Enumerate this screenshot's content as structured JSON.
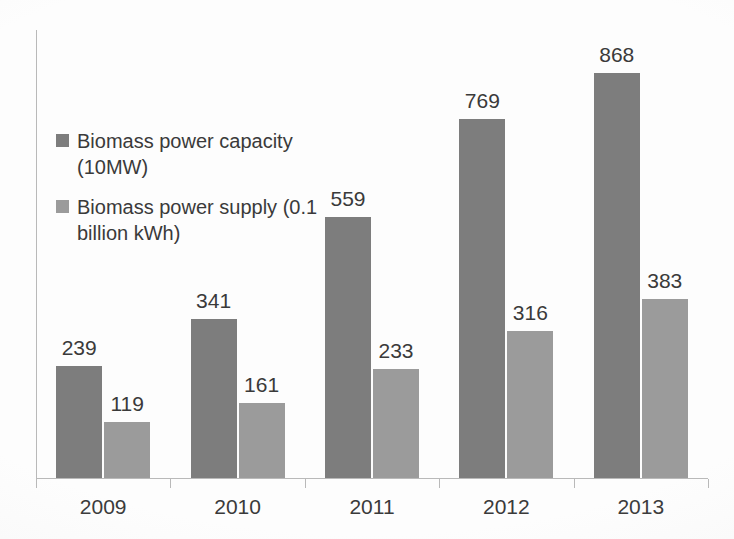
{
  "chart_data": {
    "type": "bar",
    "title": "",
    "subtitle": "",
    "xlabel": "",
    "ylabel": "",
    "grid": false,
    "legend_position": "inside-top-left",
    "y_axis_tick_labels": false,
    "ylim": [
      0,
      960
    ],
    "categories": [
      "2009",
      "2010",
      "2011",
      "2012",
      "2013"
    ],
    "series": [
      {
        "name": "Biomass power capacity (10MW)",
        "color": "#7d7d7d",
        "values": [
          239,
          341,
          559,
          769,
          868
        ],
        "labels": [
          "239",
          "341",
          "559",
          "769",
          "868"
        ]
      },
      {
        "name": "Biomass power supply (0.1 billion kWh)",
        "color": "#9b9b9b",
        "values": [
          119,
          161,
          233,
          316,
          383
        ],
        "labels": [
          "119",
          "161",
          "233",
          "316",
          "383"
        ]
      }
    ]
  },
  "legend": {
    "items": [
      {
        "label": "Biomass power capacity (10MW)",
        "swatch": "legend-swatch-capacity"
      },
      {
        "label": "Biomass power supply (0.1 billion kWh)",
        "swatch": "legend-swatch-supply"
      }
    ]
  },
  "axes": {
    "category_labels": [
      "2009",
      "2010",
      "2011",
      "2012",
      "2013"
    ]
  }
}
